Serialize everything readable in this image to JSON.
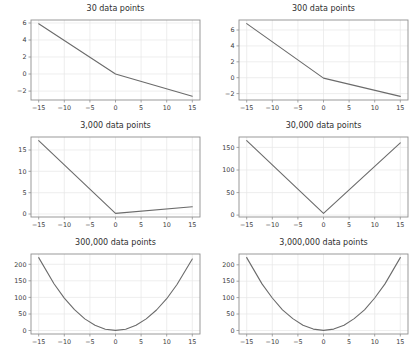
{
  "page": {
    "background": "#ffffff"
  },
  "styles": {
    "line_color": "#6b6b6b",
    "grid_color": "#e7e7e7",
    "spine_color": "#8f8f8f",
    "tick_color": "#3d3d3d",
    "title_color": "#2f2f2f"
  },
  "chart_data": [
    {
      "type": "line",
      "title": "30 data points",
      "x": [
        -15,
        0,
        15
      ],
      "y": [
        5.9,
        0,
        -2.6
      ],
      "xlim": [
        -16.5,
        16.5
      ],
      "ylim": [
        -3.05,
        6.35
      ],
      "xticks": [
        -15,
        -10,
        -5,
        0,
        5,
        10,
        15
      ],
      "yticks": [
        -2,
        0,
        2,
        4,
        6
      ],
      "grid": true,
      "legend": false
    },
    {
      "type": "line",
      "title": "300 data points",
      "x": [
        -15,
        0,
        15
      ],
      "y": [
        6.8,
        -0.05,
        -2.35
      ],
      "xlim": [
        -16.5,
        16.5
      ],
      "ylim": [
        -2.8,
        7.25
      ],
      "xticks": [
        -15,
        -10,
        -5,
        0,
        5,
        10,
        15
      ],
      "yticks": [
        -2,
        0,
        2,
        4,
        6
      ],
      "grid": true,
      "legend": false
    },
    {
      "type": "line",
      "title": "3,000 data points",
      "x": [
        -15,
        0,
        15
      ],
      "y": [
        17.2,
        0.15,
        1.7
      ],
      "xlim": [
        -16.5,
        16.5
      ],
      "ylim": [
        -0.7,
        18.05
      ],
      "xticks": [
        -15,
        -10,
        -5,
        0,
        5,
        10,
        15
      ],
      "yticks": [
        0,
        5,
        10,
        15
      ],
      "grid": true,
      "legend": false
    },
    {
      "type": "line",
      "title": "30,000 data points",
      "x": [
        -15,
        0,
        15
      ],
      "y": [
        165,
        4,
        160
      ],
      "xlim": [
        -16.5,
        16.5
      ],
      "ylim": [
        -4.1,
        173
      ],
      "xticks": [
        -15,
        -10,
        -5,
        0,
        5,
        10,
        15
      ],
      "yticks": [
        0,
        50,
        100,
        150
      ],
      "grid": true,
      "legend": false
    },
    {
      "type": "line",
      "title": "300,000 data points",
      "x": [
        -15,
        -12,
        -10,
        -8,
        -6,
        -4,
        -2,
        0,
        2,
        4,
        6,
        8,
        10,
        12,
        15
      ],
      "y": [
        220,
        141,
        98,
        63,
        35,
        16,
        4,
        0.5,
        4,
        16,
        35,
        62,
        96,
        139,
        216
      ],
      "xlim": [
        -16.5,
        16.5
      ],
      "ylim": [
        -10.5,
        231
      ],
      "xticks": [
        -15,
        -10,
        -5,
        0,
        5,
        10,
        15
      ],
      "yticks": [
        0,
        50,
        100,
        150,
        200
      ],
      "grid": true,
      "legend": false
    },
    {
      "type": "line",
      "title": "3,000,000 data points",
      "x": [
        -15,
        -12,
        -10,
        -8,
        -6,
        -4,
        -2,
        0,
        2,
        4,
        6,
        8,
        10,
        12,
        15
      ],
      "y": [
        222,
        142,
        99,
        63,
        36,
        16,
        4,
        0.3,
        4,
        16,
        36,
        63,
        99,
        142,
        222
      ],
      "xlim": [
        -16.5,
        16.5
      ],
      "ylim": [
        -10.8,
        233
      ],
      "xticks": [
        -15,
        -10,
        -5,
        0,
        5,
        10,
        15
      ],
      "yticks": [
        0,
        50,
        100,
        150,
        200
      ],
      "grid": true,
      "legend": false
    }
  ]
}
